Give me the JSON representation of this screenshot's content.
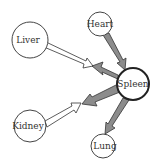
{
  "diagram": {
    "nodes": [
      {
        "id": "heart",
        "label": "Heart",
        "cx": 100,
        "cy": 24,
        "r": 12,
        "emphasis": false
      },
      {
        "id": "liver",
        "label": "Liver",
        "cx": 30,
        "cy": 40,
        "r": 18,
        "emphasis": false
      },
      {
        "id": "spleen",
        "label": "Spleen",
        "cx": 133,
        "cy": 84,
        "r": 16,
        "emphasis": true
      },
      {
        "id": "kidney",
        "label": "Kidney",
        "cx": 30,
        "cy": 126,
        "r": 16,
        "emphasis": false
      },
      {
        "id": "lung",
        "label": "Lung",
        "cx": 103,
        "cy": 146,
        "r": 12,
        "emphasis": false
      }
    ],
    "edges": [
      {
        "from": "liver",
        "to": "spleen-midpoint-upper",
        "style": "white"
      },
      {
        "from": "heart",
        "to": "spleen",
        "style": "gray"
      },
      {
        "from": "spleen",
        "to": "liver-midpoint",
        "style": "gray"
      },
      {
        "from": "kidney",
        "to": "spleen-midpoint-lower",
        "style": "white"
      },
      {
        "from": "spleen",
        "to": "kidney-midpoint",
        "style": "gray"
      },
      {
        "from": "spleen",
        "to": "lung",
        "style": "gray"
      }
    ],
    "colors": {
      "gray_arrow": "#8c8c8c",
      "white_arrow": "#ffffff",
      "stroke": "#333333"
    }
  }
}
